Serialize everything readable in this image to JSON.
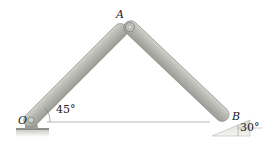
{
  "diagram": {
    "type": "mechanism",
    "points": {
      "O": {
        "label": "O"
      },
      "A": {
        "label": "A"
      },
      "B": {
        "label": "B"
      }
    },
    "angles": {
      "at_O": "45°",
      "at_B": "30°"
    },
    "links": [
      {
        "from": "O",
        "to": "A"
      },
      {
        "from": "A",
        "to": "B"
      }
    ],
    "colors": {
      "link_fill": "#b9b9b4",
      "link_edge": "#8a8a85",
      "support": "#9a9a95",
      "ground": "#d5d5d0",
      "line": "#9a9a9a"
    }
  }
}
